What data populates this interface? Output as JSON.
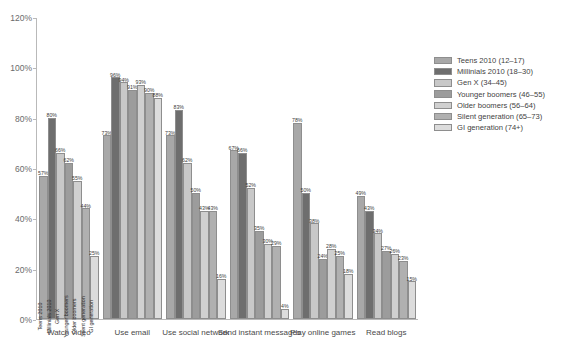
{
  "chart_data": {
    "type": "bar",
    "title": "",
    "xlabel": "",
    "ylabel": "",
    "ylim": [
      0,
      120
    ],
    "ytick_labels": [
      "0%",
      "20%",
      "40%",
      "60%",
      "80%",
      "100%",
      "120%"
    ],
    "ytick_values": [
      0,
      20,
      40,
      60,
      80,
      100,
      120
    ],
    "grid": false,
    "legend_position": "right",
    "categories": [
      "Watch video",
      "Use email",
      "Use social network",
      "Send instant messages",
      "Play online games",
      "Read blogs"
    ],
    "series": [
      {
        "name": "Teens 2010 (12–17)",
        "color": "#a8a8a8",
        "values": [
          57,
          73,
          73,
          67,
          78,
          49
        ]
      },
      {
        "name": "Millinials 2010 (18–30)",
        "color": "#6e6e6e",
        "values": [
          80,
          96,
          83,
          66,
          50,
          43
        ]
      },
      {
        "name": "Gen X (34–45)",
        "color": "#c8c8c8",
        "values": [
          66,
          94,
          62,
          52,
          38,
          34
        ]
      },
      {
        "name": "Younger boomers (46–55)",
        "color": "#9c9c9c",
        "values": [
          62,
          91,
          50,
          35,
          24,
          27
        ]
      },
      {
        "name": "Older boomers (56–64)",
        "color": "#d0d0d0",
        "values": [
          55,
          93,
          43,
          30,
          28,
          26
        ]
      },
      {
        "name": "Silent generation (65–73)",
        "color": "#b0b0b0",
        "values": [
          44,
          90,
          43,
          29,
          25,
          23
        ]
      },
      {
        "name": "GI generation (74+)",
        "color": "#dcdcdc",
        "values": [
          25,
          88,
          16,
          4,
          18,
          15
        ]
      }
    ],
    "bar_labels": [
      [
        "57%",
        "80%",
        "66%",
        "62%",
        "55%",
        "44%",
        "25%"
      ],
      [
        "73%",
        "96%",
        "94%",
        "91%",
        "93%",
        "90%",
        "88%"
      ],
      [
        "73%",
        "83%",
        "62%",
        "50%",
        "43%",
        "43%",
        "16%"
      ],
      [
        "67%",
        "66%",
        "52%",
        "35%",
        "30%",
        "29%",
        "4%"
      ],
      [
        "78%",
        "50%",
        "38%",
        "24%",
        "28%",
        "25%",
        "18%"
      ],
      [
        "49%",
        "43%",
        "34%",
        "27%",
        "26%",
        "23%",
        "15%"
      ]
    ],
    "in_bar_labels": [
      "Teens 2010",
      "Millinials 2010",
      "Gen X",
      "Younger boomers",
      "Older boomers",
      "Silent generation",
      "GI generation"
    ]
  }
}
